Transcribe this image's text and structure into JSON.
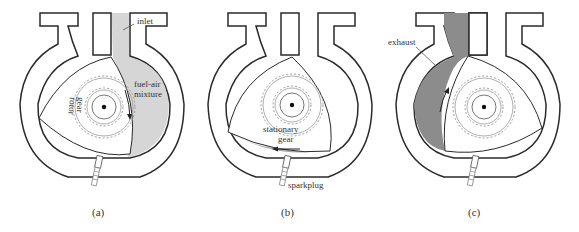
{
  "figure": {
    "type": "rotary engine cycle diagram",
    "colors": {
      "outline": "#2a2a2a",
      "intake_fill": "#d6d6d6",
      "exhaust_fill": "#8c8c8c",
      "compression_fill": "#a8a8a8",
      "gear": "#9a9a9a",
      "background": "#ffffff"
    },
    "panels": [
      {
        "caption": "(a)",
        "labels": {
          "inlet": "inlet",
          "mixture_line1": "fuel-air",
          "mixture_line2": "mixture",
          "rotor_line1": "rotor",
          "rotor_line2": "gear"
        }
      },
      {
        "caption": "(b)",
        "labels": {
          "stationary_line1": "stationary",
          "stationary_line2": "gear",
          "sparkplug": "sparkplug"
        }
      },
      {
        "caption": "(c)",
        "labels": {
          "exhaust": "exhaust"
        }
      }
    ]
  }
}
